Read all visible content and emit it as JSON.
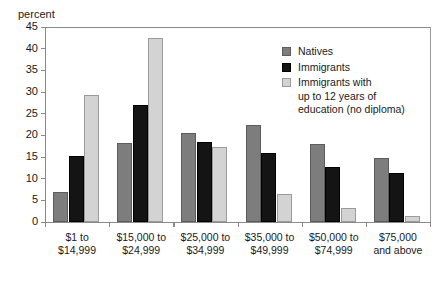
{
  "chart_data": {
    "type": "bar",
    "title": "",
    "xlabel": "",
    "ylabel": "percent",
    "ylim": [
      0,
      45
    ],
    "ytick_step": 5,
    "yticks": [
      0,
      5,
      10,
      15,
      20,
      25,
      30,
      35,
      40,
      45
    ],
    "grid": false,
    "legend_position": "upper right",
    "categories": [
      "$1 to\n$14,999",
      "$15,000 to\n$24,999",
      "$25,000 to\n$34,999",
      "$35,000 to\n$49,999",
      "$50,000 to\n$74,999",
      "$75,000\nand above"
    ],
    "series": [
      {
        "name": "Natives",
        "color": "#7d7d7d",
        "values": [
          6.9,
          18.2,
          20.5,
          22.4,
          18.0,
          14.7
        ]
      },
      {
        "name": "Immigrants",
        "color": "#141414",
        "values": [
          15.3,
          26.9,
          18.5,
          16.0,
          12.8,
          11.2
        ]
      },
      {
        "name": "Immigrants with\nup to 12 years of\neducation (no diploma)",
        "color": "#d3d3d3",
        "values": [
          29.2,
          42.5,
          17.4,
          6.5,
          3.2,
          1.5
        ]
      }
    ]
  },
  "axis": {
    "unit_label": "percent"
  },
  "legend": {
    "items": [
      {
        "label": "Natives",
        "swatch": "natives"
      },
      {
        "label": "Immigrants",
        "swatch": "immigrants"
      },
      {
        "label": "Immigrants with\nup to 12 years of\neducation (no diploma)",
        "swatch": "lowed"
      }
    ]
  }
}
